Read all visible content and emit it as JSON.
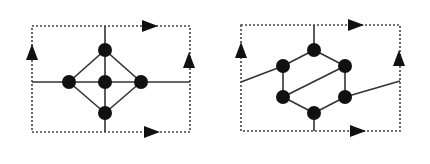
{
  "colors": {
    "background": "#ffffff",
    "ink": "#111111",
    "edge": "#333333",
    "border": "#444444"
  },
  "diagrams": [
    {
      "name": "square-lattice-cell",
      "box": {
        "x1": 32,
        "y1": 26,
        "x2": 190,
        "y2": 132
      },
      "nodes": [
        {
          "x": 105,
          "y": 50
        },
        {
          "x": 69,
          "y": 82
        },
        {
          "x": 105,
          "y": 82
        },
        {
          "x": 141,
          "y": 82
        },
        {
          "x": 105,
          "y": 113
        }
      ],
      "edges": [
        [
          105,
          26,
          105,
          50
        ],
        [
          105,
          113,
          105,
          132
        ],
        [
          32,
          82,
          69,
          82
        ],
        [
          141,
          82,
          190,
          82
        ],
        [
          69,
          82,
          105,
          82
        ],
        [
          105,
          82,
          141,
          82
        ],
        [
          105,
          50,
          105,
          82
        ],
        [
          105,
          82,
          105,
          113
        ],
        [
          105,
          50,
          69,
          82
        ],
        [
          105,
          50,
          141,
          82
        ],
        [
          69,
          82,
          105,
          113
        ],
        [
          141,
          82,
          105,
          113
        ]
      ],
      "arrows": [
        {
          "x": 150,
          "y": 26,
          "dir": "right"
        },
        {
          "x": 152,
          "y": 132,
          "dir": "right"
        },
        {
          "x": 32,
          "y": 52,
          "dir": "up"
        },
        {
          "x": 189,
          "y": 60,
          "dir": "up"
        }
      ]
    },
    {
      "name": "hexagonal-lattice-cell",
      "box": {
        "x1": 241,
        "y1": 25,
        "x2": 400,
        "y2": 131
      },
      "nodes": [
        {
          "x": 314,
          "y": 50
        },
        {
          "x": 283,
          "y": 66
        },
        {
          "x": 345,
          "y": 66
        },
        {
          "x": 283,
          "y": 97
        },
        {
          "x": 345,
          "y": 97
        },
        {
          "x": 314,
          "y": 113
        }
      ],
      "edges": [
        [
          314,
          25,
          314,
          50
        ],
        [
          314,
          113,
          314,
          131
        ],
        [
          241,
          82,
          283,
          66
        ],
        [
          345,
          97,
          400,
          81
        ],
        [
          314,
          50,
          283,
          66
        ],
        [
          314,
          50,
          345,
          66
        ],
        [
          283,
          66,
          283,
          97
        ],
        [
          345,
          66,
          345,
          97
        ],
        [
          283,
          97,
          314,
          113
        ],
        [
          345,
          97,
          314,
          113
        ],
        [
          283,
          97,
          345,
          66
        ]
      ],
      "arrows": [
        {
          "x": 356,
          "y": 25,
          "dir": "right"
        },
        {
          "x": 358,
          "y": 131,
          "dir": "right"
        },
        {
          "x": 241,
          "y": 50,
          "dir": "up"
        },
        {
          "x": 399,
          "y": 58,
          "dir": "up"
        }
      ]
    }
  ]
}
